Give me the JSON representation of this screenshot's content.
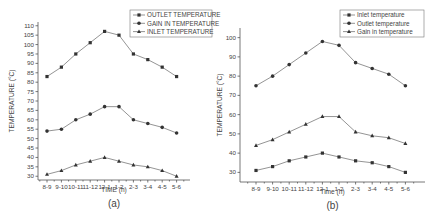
{
  "chart_data": [
    {
      "type": "line",
      "caption": "(a)",
      "title": "",
      "xlabel": "TIME (h)",
      "ylabel": "TEMPERATURE (°C)",
      "categories": [
        "8-9",
        "9-10",
        "10-11",
        "11-12",
        "12-1",
        "1-2",
        "2-3",
        "3-4",
        "4-5",
        "5-6"
      ],
      "ylim": [
        28,
        112
      ],
      "yticks": [
        30,
        35,
        40,
        45,
        50,
        55,
        60,
        65,
        70,
        75,
        80,
        85,
        90,
        95,
        100,
        105,
        110
      ],
      "grid": false,
      "legend_position": "top-right",
      "series": [
        {
          "name": "OUTLET TEMPERATURE",
          "marker": "square",
          "values": [
            83,
            88,
            95,
            101,
            107,
            105,
            95,
            92,
            88,
            83
          ]
        },
        {
          "name": "GAIN IN TEMPERATURE",
          "marker": "circle",
          "values": [
            54,
            55,
            60,
            63,
            67,
            67,
            60,
            58,
            56,
            53
          ]
        },
        {
          "name": "INLET TEMPERATURE",
          "marker": "triangle",
          "values": [
            31,
            33,
            36,
            38,
            40,
            38,
            36,
            35,
            33,
            30
          ]
        }
      ]
    },
    {
      "type": "line",
      "caption": "(b)",
      "title": "",
      "xlabel": "Time (h)",
      "ylabel": "TEMPERATURE (°C)",
      "categories": [
        "8-9",
        "9-10",
        "10-11",
        "11-12",
        "12-1",
        "1-2",
        "2-3",
        "3-4",
        "4-5",
        "5-6"
      ],
      "ylim": [
        25,
        105
      ],
      "yticks": [
        30,
        40,
        50,
        60,
        70,
        80,
        90,
        100
      ],
      "grid": false,
      "legend_position": "top-right",
      "series": [
        {
          "name": "Inlet temperature",
          "marker": "square",
          "values": [
            31,
            33,
            36,
            38,
            40,
            38,
            36,
            35,
            33,
            30
          ]
        },
        {
          "name": "Outlet temperature",
          "marker": "circle",
          "values": [
            75,
            80,
            86,
            92,
            98,
            96,
            87,
            84,
            81,
            75
          ]
        },
        {
          "name": "Gain in temperature",
          "marker": "triangle",
          "values": [
            44,
            47,
            51,
            55,
            59,
            59,
            51,
            49,
            48,
            45
          ]
        }
      ]
    }
  ]
}
